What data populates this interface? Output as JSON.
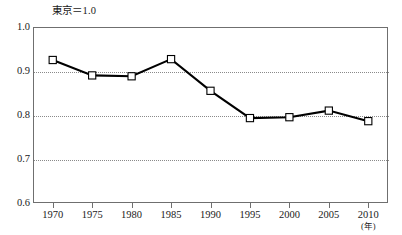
{
  "chart_data": {
    "type": "line",
    "title": "東京＝1.0",
    "xlabel": "(年)",
    "ylabel": "",
    "x": [
      1970,
      1975,
      1980,
      1985,
      1990,
      1995,
      2000,
      2005,
      2010
    ],
    "xtick_labels": [
      "1970",
      "1975",
      "1980",
      "1985",
      "1990",
      "1995",
      "2000",
      "2005",
      "2010"
    ],
    "values": [
      0.925,
      0.89,
      0.888,
      0.927,
      0.855,
      0.793,
      0.795,
      0.81,
      0.786
    ],
    "ytick_labels": [
      "1.0",
      "0.9",
      "0.8",
      "0.7",
      "0.6"
    ],
    "ytick_values": [
      1.0,
      0.9,
      0.8,
      0.7,
      0.6
    ],
    "ylim": [
      0.6,
      1.0
    ],
    "xlim": [
      1967.5,
      2012.5
    ],
    "grid": "horizontal-dotted",
    "legend": "none",
    "marker": "open-square",
    "line_color": "#000000",
    "marker_fill": "#ffffff",
    "frame_color": "#6f6f6f",
    "grid_color": "#8a8a8a"
  }
}
